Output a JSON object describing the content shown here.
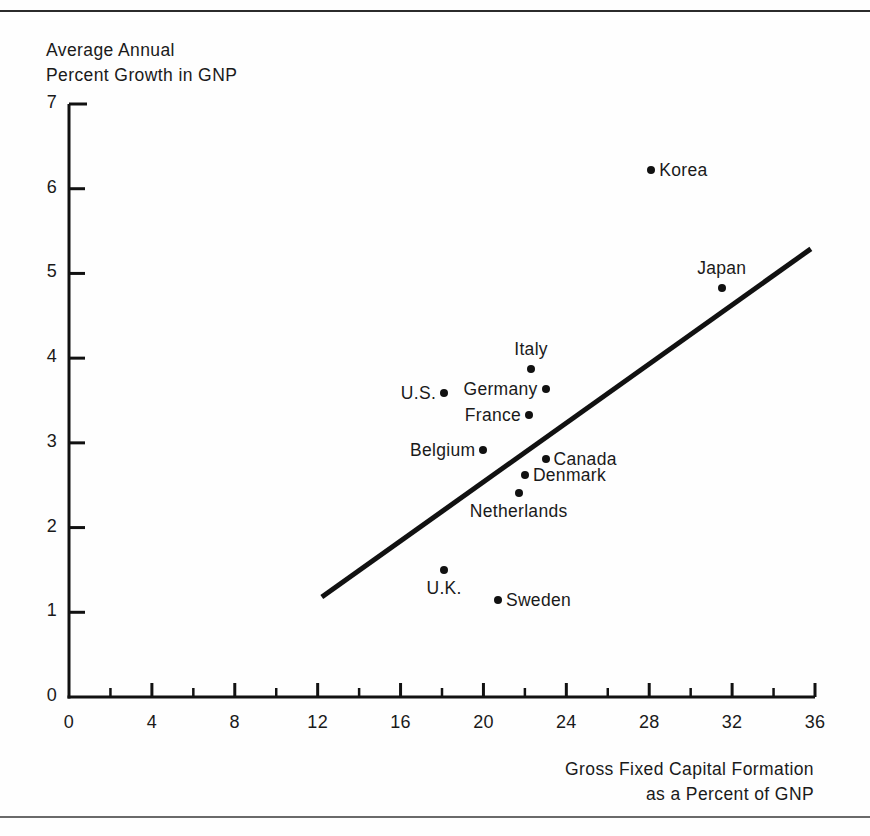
{
  "figure": {
    "has_top_rule": true,
    "has_bottom_rule": true,
    "background_color": "#fefefe",
    "ink_color": "#111111"
  },
  "chart_data": {
    "type": "scatter",
    "title": "",
    "xlabel": "Gross Fixed Capital Formation\nas a Percent of GNP",
    "ylabel": "Average Annual\nPercent Growth in GNP",
    "xlim": [
      0,
      36
    ],
    "ylim": [
      0,
      7
    ],
    "grid": false,
    "legend": "none",
    "x_ticks": [
      0,
      4,
      8,
      12,
      16,
      20,
      24,
      28,
      32,
      36
    ],
    "x_tick_labels": [
      "0",
      "4",
      "8",
      "12",
      "16",
      "20",
      "24",
      "28",
      "32",
      "36"
    ],
    "x_minor_ticks": [
      2,
      6,
      10,
      14,
      18,
      22,
      26,
      30,
      34
    ],
    "y_ticks": [
      0,
      1,
      2,
      3,
      4,
      5,
      6,
      7
    ],
    "y_tick_labels": [
      "0",
      "1",
      "2",
      "3",
      "4",
      "5",
      "6",
      "7"
    ],
    "points": [
      {
        "label": "Korea",
        "x": 28.1,
        "y": 6.22,
        "label_pos": "right"
      },
      {
        "label": "Japan",
        "x": 31.5,
        "y": 4.83,
        "label_pos": "above"
      },
      {
        "label": "Italy",
        "x": 22.3,
        "y": 3.87,
        "label_pos": "above"
      },
      {
        "label": "Germany",
        "x": 23.0,
        "y": 3.63,
        "label_pos": "left"
      },
      {
        "label": "U.S.",
        "x": 18.1,
        "y": 3.59,
        "label_pos": "left"
      },
      {
        "label": "France",
        "x": 22.2,
        "y": 3.33,
        "label_pos": "left"
      },
      {
        "label": "Belgium",
        "x": 20.0,
        "y": 2.92,
        "label_pos": "left"
      },
      {
        "label": "Canada",
        "x": 23.0,
        "y": 2.81,
        "label_pos": "right"
      },
      {
        "label": "Denmark",
        "x": 22.0,
        "y": 2.62,
        "label_pos": "right"
      },
      {
        "label": "Netherlands",
        "x": 21.7,
        "y": 2.41,
        "label_pos": "below"
      },
      {
        "label": "U.K.",
        "x": 18.1,
        "y": 1.5,
        "label_pos": "below"
      },
      {
        "label": "Sweden",
        "x": 20.7,
        "y": 1.15,
        "label_pos": "right"
      }
    ],
    "trend_line": {
      "x0": 12.2,
      "y0": 1.18,
      "x1": 35.8,
      "y1": 5.29,
      "width": 5
    }
  }
}
